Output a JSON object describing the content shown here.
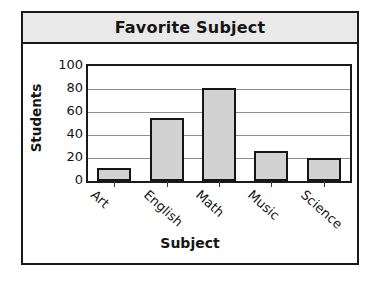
{
  "chart_data": {
    "type": "bar",
    "title": "Favorite Subject",
    "xlabel": "Subject",
    "ylabel": "Students",
    "categories": [
      "Art",
      "English",
      "Math",
      "Music",
      "Science"
    ],
    "values": [
      11,
      55,
      81,
      26,
      20
    ],
    "ylim": [
      0,
      100
    ],
    "yticks": [
      0,
      20,
      40,
      60,
      80,
      100
    ],
    "ytick_labels": [
      "0",
      "20",
      "40",
      "60",
      "80",
      "100"
    ],
    "grid": true,
    "legend": false,
    "bar_color": "#d2d2d2",
    "bar_edge_color": "#151515",
    "title_band_color": "#e9e9e9",
    "frame_color": "#1a1a1a",
    "gridline_color": "#8f8f8f"
  }
}
